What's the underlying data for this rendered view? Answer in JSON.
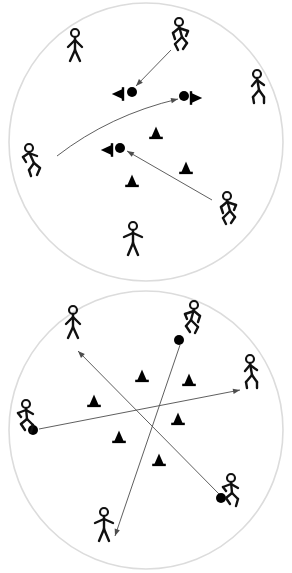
{
  "figure": {
    "title": "Soccer drill diagram",
    "panel_count": 2,
    "background_color": "#ffffff",
    "boundary_color": "#dcdcdc",
    "ink_color": "#111111",
    "arrow_color": "#4d4d4d"
  },
  "panels": [
    {
      "id": "top-panel",
      "label": "Top drill circle",
      "boundary": {
        "cx": 146,
        "cy": 142,
        "rx": 137,
        "ry": 139
      },
      "players": [
        {
          "name": "player-top-left-standing",
          "pose": "standing",
          "x": 75,
          "y": 48,
          "facing": "front",
          "scale": 1.0
        },
        {
          "name": "player-top-right-running",
          "pose": "running",
          "x": 181,
          "y": 37,
          "facing": "left",
          "scale": 1.0
        },
        {
          "name": "player-right-walking",
          "pose": "walking",
          "x": 258,
          "y": 89,
          "facing": "left",
          "scale": 1.0
        },
        {
          "name": "player-left-leaning",
          "pose": "leaning",
          "x": 32,
          "y": 162,
          "facing": "right",
          "scale": 1.0
        },
        {
          "name": "player-bottom-right-running",
          "pose": "running",
          "x": 229,
          "y": 211,
          "facing": "left",
          "scale": 1.0
        },
        {
          "name": "player-bottom-standing",
          "pose": "standing-arms-out",
          "x": 133,
          "y": 241,
          "facing": "front",
          "scale": 1.0
        }
      ],
      "balls": [
        {
          "name": "ball-upper",
          "x": 132,
          "y": 92,
          "r": 5
        },
        {
          "name": "ball-right",
          "x": 184,
          "y": 96,
          "r": 5
        },
        {
          "name": "ball-center",
          "x": 120,
          "y": 148,
          "r": 5
        }
      ],
      "cones": [
        {
          "name": "cone-beside-ball-upper",
          "x": 119,
          "y": 94,
          "orientation": "left",
          "size": 8
        },
        {
          "name": "cone-beside-ball-right",
          "x": 195,
          "y": 98,
          "orientation": "right",
          "size": 8
        },
        {
          "name": "cone-beside-ball-center",
          "x": 108,
          "y": 150,
          "orientation": "left",
          "size": 8
        },
        {
          "name": "cone-mid-upright",
          "x": 156,
          "y": 134,
          "orientation": "up",
          "size": 8
        },
        {
          "name": "cone-lower-right-upright",
          "x": 186,
          "y": 169,
          "orientation": "up",
          "size": 8
        },
        {
          "name": "cone-lower-left-upright",
          "x": 132,
          "y": 182,
          "orientation": "up",
          "size": 8
        }
      ],
      "arrows": [
        {
          "name": "arrow-pass-from-top-right-player-to-upper-ball",
          "type": "straight",
          "x1": 171,
          "y1": 50,
          "x2": 136,
          "y2": 86
        },
        {
          "name": "arrow-curved-pass-to-right-ball",
          "type": "curved",
          "x1": 57,
          "y1": 156,
          "x2": 178,
          "y2": 99,
          "cx": 110,
          "cy": 115
        },
        {
          "name": "arrow-pass-from-bottom-right-player-to-center-ball",
          "type": "straight",
          "x1": 212,
          "y1": 200,
          "x2": 127,
          "y2": 151
        }
      ]
    },
    {
      "id": "bottom-panel",
      "label": "Bottom drill circle",
      "boundary": {
        "cx": 146,
        "cy": 430,
        "rx": 137,
        "ry": 139
      },
      "players": [
        {
          "name": "player-upper-left-standing",
          "pose": "standing",
          "x": 73,
          "y": 325,
          "facing": "front",
          "scale": 1.0
        },
        {
          "name": "player-upper-right-running",
          "pose": "running",
          "x": 192,
          "y": 320,
          "facing": "right",
          "scale": 1.0
        },
        {
          "name": "player-right-walking",
          "pose": "walking",
          "x": 251,
          "y": 374,
          "facing": "left",
          "scale": 1.0
        },
        {
          "name": "player-left-kicking",
          "pose": "kicking",
          "x": 26,
          "y": 419,
          "facing": "right",
          "scale": 1.0
        },
        {
          "name": "player-lower-right-kicking",
          "pose": "kicking",
          "x": 231,
          "y": 493,
          "facing": "right",
          "scale": 1.0
        },
        {
          "name": "player-bottom-standing",
          "pose": "standing-arms-out",
          "x": 104,
          "y": 527,
          "facing": "front",
          "scale": 1.0
        }
      ],
      "balls": [
        {
          "name": "ball-upper-right",
          "x": 179,
          "y": 340,
          "r": 5
        },
        {
          "name": "ball-left",
          "x": 33,
          "y": 430,
          "r": 5
        },
        {
          "name": "ball-lower-right",
          "x": 221,
          "y": 498,
          "r": 5
        }
      ],
      "cones": [
        {
          "name": "cone-top-center",
          "x": 142,
          "y": 377,
          "orientation": "up",
          "size": 8
        },
        {
          "name": "cone-top-right",
          "x": 189,
          "y": 381,
          "orientation": "up",
          "size": 8
        },
        {
          "name": "cone-mid-left",
          "x": 94,
          "y": 402,
          "orientation": "up",
          "size": 8
        },
        {
          "name": "cone-mid-right",
          "x": 178,
          "y": 420,
          "orientation": "up",
          "size": 8
        },
        {
          "name": "cone-lower-left",
          "x": 119,
          "y": 438,
          "orientation": "up",
          "size": 8
        },
        {
          "name": "cone-lower-center",
          "x": 159,
          "y": 461,
          "orientation": "up",
          "size": 8
        }
      ],
      "arrows": [
        {
          "name": "arrow-pass-left-ball-to-right-player",
          "type": "straight",
          "x1": 39,
          "y1": 429,
          "x2": 240,
          "y2": 390
        },
        {
          "name": "arrow-pass-lower-right-ball-to-upper-left-player",
          "type": "straight",
          "x1": 219,
          "y1": 494,
          "x2": 78,
          "y2": 351
        },
        {
          "name": "arrow-pass-upper-right-ball-to-bottom-player",
          "type": "straight",
          "x1": 180,
          "y1": 345,
          "x2": 115,
          "y2": 536
        }
      ]
    }
  ],
  "legend": {
    "ball_label": "ball",
    "cone_label": "cone",
    "player_label": "player",
    "arrow_label": "pass / run direction"
  }
}
